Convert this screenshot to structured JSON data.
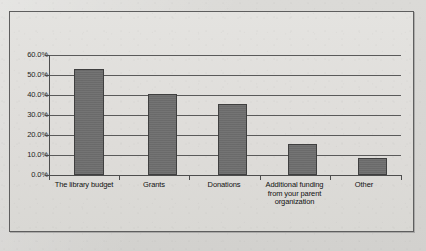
{
  "chart_data": {
    "type": "bar",
    "title": "",
    "xlabel": "",
    "ylabel": "",
    "categories": [
      "The library budget",
      "Grants",
      "Donations",
      "Additional funding from your parent organization",
      "Other"
    ],
    "values": [
      53.0,
      40.3,
      35.5,
      15.7,
      8.3
    ],
    "value_labels": [
      "53.0%",
      "40.3%",
      "35.5%",
      "15.7%",
      "8.3%"
    ],
    "ylim": [
      0,
      60
    ],
    "ytick_labels": [
      "60.0%",
      "50.0%",
      "40.0%",
      "30.0%",
      "20.0%",
      "10.0%",
      "0.0%"
    ],
    "ytick_values": [
      60,
      50,
      40,
      30,
      20,
      10,
      0
    ],
    "grid": "horizontal",
    "legend": "none",
    "series": [
      {
        "name": "",
        "values": [
          53.0,
          40.3,
          35.5,
          15.7,
          8.3
        ]
      }
    ],
    "bar_color": "#6e6e6e",
    "bar_edge_color": "#3f3f3f",
    "axis_color": "#4d4d4d",
    "gridline_color": "#5a5a5a",
    "plot_background": "#e0dfdc",
    "page_background": "#d9d8d5"
  },
  "category_label_lines": [
    [
      "The library budget"
    ],
    [
      "Grants"
    ],
    [
      "Donations"
    ],
    [
      "Additional funding",
      "from your parent",
      "organization"
    ],
    [
      "Other"
    ]
  ],
  "caption": {
    "fragment": ""
  }
}
